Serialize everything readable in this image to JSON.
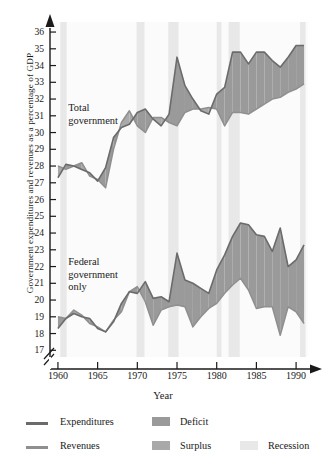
{
  "chart_data": {
    "type": "area",
    "title": "",
    "xlabel": "Year",
    "ylabel": "Government expenditures and revenues as a percentage of GDP",
    "xlim": [
      1959,
      1991.5
    ],
    "ylim": [
      16.6,
      36.6
    ],
    "y_axis_break": true,
    "y_ticks": [
      17,
      18,
      19,
      20,
      21,
      22,
      23,
      24,
      25,
      26,
      27,
      28,
      29,
      30,
      31,
      32,
      33,
      34,
      35,
      36
    ],
    "x_ticks": [
      1960,
      1965,
      1970,
      1975,
      1980,
      1985,
      1990
    ],
    "grid": false,
    "legend_position": "below",
    "annotations": [
      {
        "text": "Total government",
        "x": 1961.3,
        "y": 31.4
      },
      {
        "text": "Federal government only",
        "x": 1961.3,
        "y": 22.2
      }
    ],
    "x": [
      1960,
      1961,
      1962,
      1963,
      1964,
      1965,
      1966,
      1967,
      1968,
      1969,
      1970,
      1971,
      1972,
      1973,
      1974,
      1975,
      1976,
      1977,
      1978,
      1979,
      1980,
      1981,
      1982,
      1983,
      1984,
      1985,
      1986,
      1987,
      1988,
      1989,
      1990,
      1991
    ],
    "series": [
      {
        "name": "Total government expenditures",
        "group": "Total government",
        "values": [
          27.3,
          28.1,
          28.0,
          27.8,
          27.6,
          27.1,
          27.9,
          29.7,
          30.3,
          30.5,
          31.2,
          31.4,
          30.8,
          30.4,
          31.1,
          34.5,
          32.8,
          32.0,
          31.3,
          31.1,
          32.3,
          32.7,
          34.8,
          34.8,
          34.1,
          34.8,
          34.8,
          34.3,
          33.9,
          34.5,
          35.2,
          35.2
        ]
      },
      {
        "name": "Total government revenues",
        "group": "Total government",
        "values": [
          28.0,
          27.8,
          28.0,
          28.2,
          27.4,
          27.2,
          26.7,
          29.0,
          30.6,
          31.3,
          30.4,
          30.0,
          30.9,
          30.9,
          30.6,
          30.4,
          31.2,
          31.4,
          31.4,
          31.5,
          31.4,
          30.4,
          31.2,
          31.2,
          31.1,
          31.4,
          31.7,
          32.0,
          32.1,
          32.4,
          32.6,
          32.9
        ]
      },
      {
        "name": "Federal government expenditures",
        "group": "Federal government only",
        "values": [
          18.3,
          18.9,
          19.2,
          19.0,
          18.9,
          18.3,
          18.1,
          18.7,
          19.8,
          20.5,
          20.4,
          21.1,
          20.1,
          20.2,
          19.9,
          22.8,
          21.2,
          21.0,
          20.7,
          20.4,
          21.8,
          22.7,
          23.8,
          24.6,
          24.5,
          23.9,
          23.8,
          22.9,
          24.3,
          22.0,
          22.4,
          23.3
        ]
      },
      {
        "name": "Federal government revenues",
        "group": "Federal government only",
        "values": [
          19.0,
          18.9,
          19.4,
          19.1,
          18.6,
          18.4,
          18.1,
          18.8,
          19.3,
          20.5,
          20.8,
          19.9,
          18.5,
          19.4,
          19.6,
          19.7,
          19.6,
          18.4,
          19.0,
          19.5,
          19.8,
          20.4,
          20.9,
          21.3,
          20.6,
          19.5,
          19.6,
          19.6,
          17.9,
          19.6,
          19.3,
          18.6
        ]
      }
    ],
    "recession_bands": [
      {
        "start": 1960.3,
        "end": 1961.1
      },
      {
        "start": 1969.9,
        "end": 1970.9
      },
      {
        "start": 1973.9,
        "end": 1975.2
      },
      {
        "start": 1980.0,
        "end": 1980.6
      },
      {
        "start": 1981.5,
        "end": 1982.9
      },
      {
        "start": 1990.5,
        "end": 1991.2
      }
    ]
  },
  "legend": {
    "expenditures_label": "Expenditures",
    "revenues_label": "Revenues",
    "deficit_label": "Deficit",
    "surplus_label": "Surplus",
    "recession_label": "Recession"
  },
  "colors": {
    "expenditures_line": "#6b6b6b",
    "revenues_line": "#8f8f8f",
    "deficit_fill": "#9a9a9a",
    "surplus_fill": "#a9a9a9",
    "recession_fill": "#e8e8e8",
    "axis": "#1a1a1a",
    "text": "#1a1a1a",
    "plot_bg": "#fbfbfb"
  }
}
